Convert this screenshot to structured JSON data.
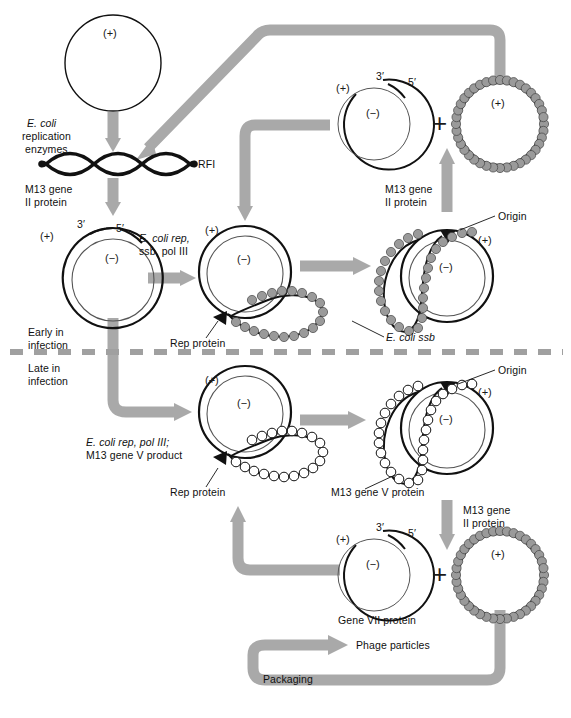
{
  "figure": {
    "colors": {
      "arrow_gray": "#a9a9a9",
      "divider_gray": "#9e9e9e",
      "dna_black": "#111111",
      "ssb_bead_fill": "#9a9a9a",
      "geneV_bead_fill": "#ffffff"
    }
  },
  "phases": {
    "early_label": "Early in\ninfection",
    "early_line1": "Early in",
    "early_line2": "infection",
    "late_line1": "Late in",
    "late_line2": "infection"
  },
  "steps": {
    "ecoli_replication_enzymes_l1": "E. coli",
    "ecoli_replication_enzymes_l2": "replication",
    "ecoli_replication_enzymes_l3": "enzymes",
    "rfi": "RFI",
    "m13_gene_II_protein_l1": "M13 gene",
    "m13_gene_II_protein_l2": "II protein",
    "ecoli_rep_ssb_pol3_l1": "E. coli rep,",
    "ecoli_rep_ssb_pol3_l2": "ssb, pol III",
    "ecoli_rep_pol3_geneV_l1": "E. coli rep, pol III;",
    "ecoli_rep_pol3_geneV_l2": "M13 gene V product",
    "m13_gene_II_protein_right_l1": "M13 gene",
    "m13_gene_II_protein_right_l2": "II protein",
    "m13_gene_II_protein_late_l1": "M13 gene",
    "m13_gene_II_protein_late_l2": "II protein"
  },
  "annotations": {
    "rep_protein_early": "Rep protein",
    "rep_protein_late": "Rep protein",
    "ecoli_ssb": "E. coli ssb",
    "m13_gene_V_protein": "M13 gene V protein",
    "origin_early": "Origin",
    "origin_late": "Origin",
    "gene_VII_protein": "Gene VII protein",
    "phage_particles": "Phage particles",
    "packaging": "Packaging"
  },
  "strand_marks": {
    "plus": "(+)",
    "minus": "(−)",
    "three_prime": "3′",
    "five_prime": "5′",
    "plus_sign": "+"
  },
  "molecules": [
    {
      "id": "ss-plus-circle-top-left",
      "type": "single-stranded-circle",
      "label": "(+)"
    },
    {
      "id": "rfi-supercoil",
      "type": "supercoiled-duplex",
      "label": "RFI"
    },
    {
      "id": "rf-circle-early",
      "type": "double-stranded-circle",
      "labels": [
        "(+)",
        "(−)",
        "3′",
        "5′"
      ]
    },
    {
      "id": "rolling-circle-early-nicked",
      "type": "rolling-circle",
      "labels": [
        "(+)",
        "(−)"
      ]
    },
    {
      "id": "rolling-circle-early-ssb",
      "type": "rolling-circle-ssb-coated",
      "labels": [
        "(+)",
        "(−)",
        "Origin"
      ]
    },
    {
      "id": "rf-circle-product-early",
      "type": "double-stranded-circle",
      "labels": [
        "(+)",
        "(−)",
        "3′",
        "5′"
      ]
    },
    {
      "id": "ssb-coated-plus-circle",
      "type": "ssb-coated-circle",
      "label": "(+)"
    },
    {
      "id": "rf-circle-late",
      "type": "double-stranded-circle",
      "labels": [
        "(+)",
        "(−)"
      ]
    },
    {
      "id": "rolling-circle-late-geneV",
      "type": "rolling-circle-geneV-coated",
      "labels": [
        "(+)",
        "(−)",
        "Origin"
      ]
    },
    {
      "id": "rf-circle-product-late",
      "type": "double-stranded-circle",
      "labels": [
        "(+)",
        "(−)",
        "3′",
        "5′"
      ]
    },
    {
      "id": "geneV-coated-plus-circle",
      "type": "geneV-coated-circle",
      "label": "(+)"
    }
  ]
}
